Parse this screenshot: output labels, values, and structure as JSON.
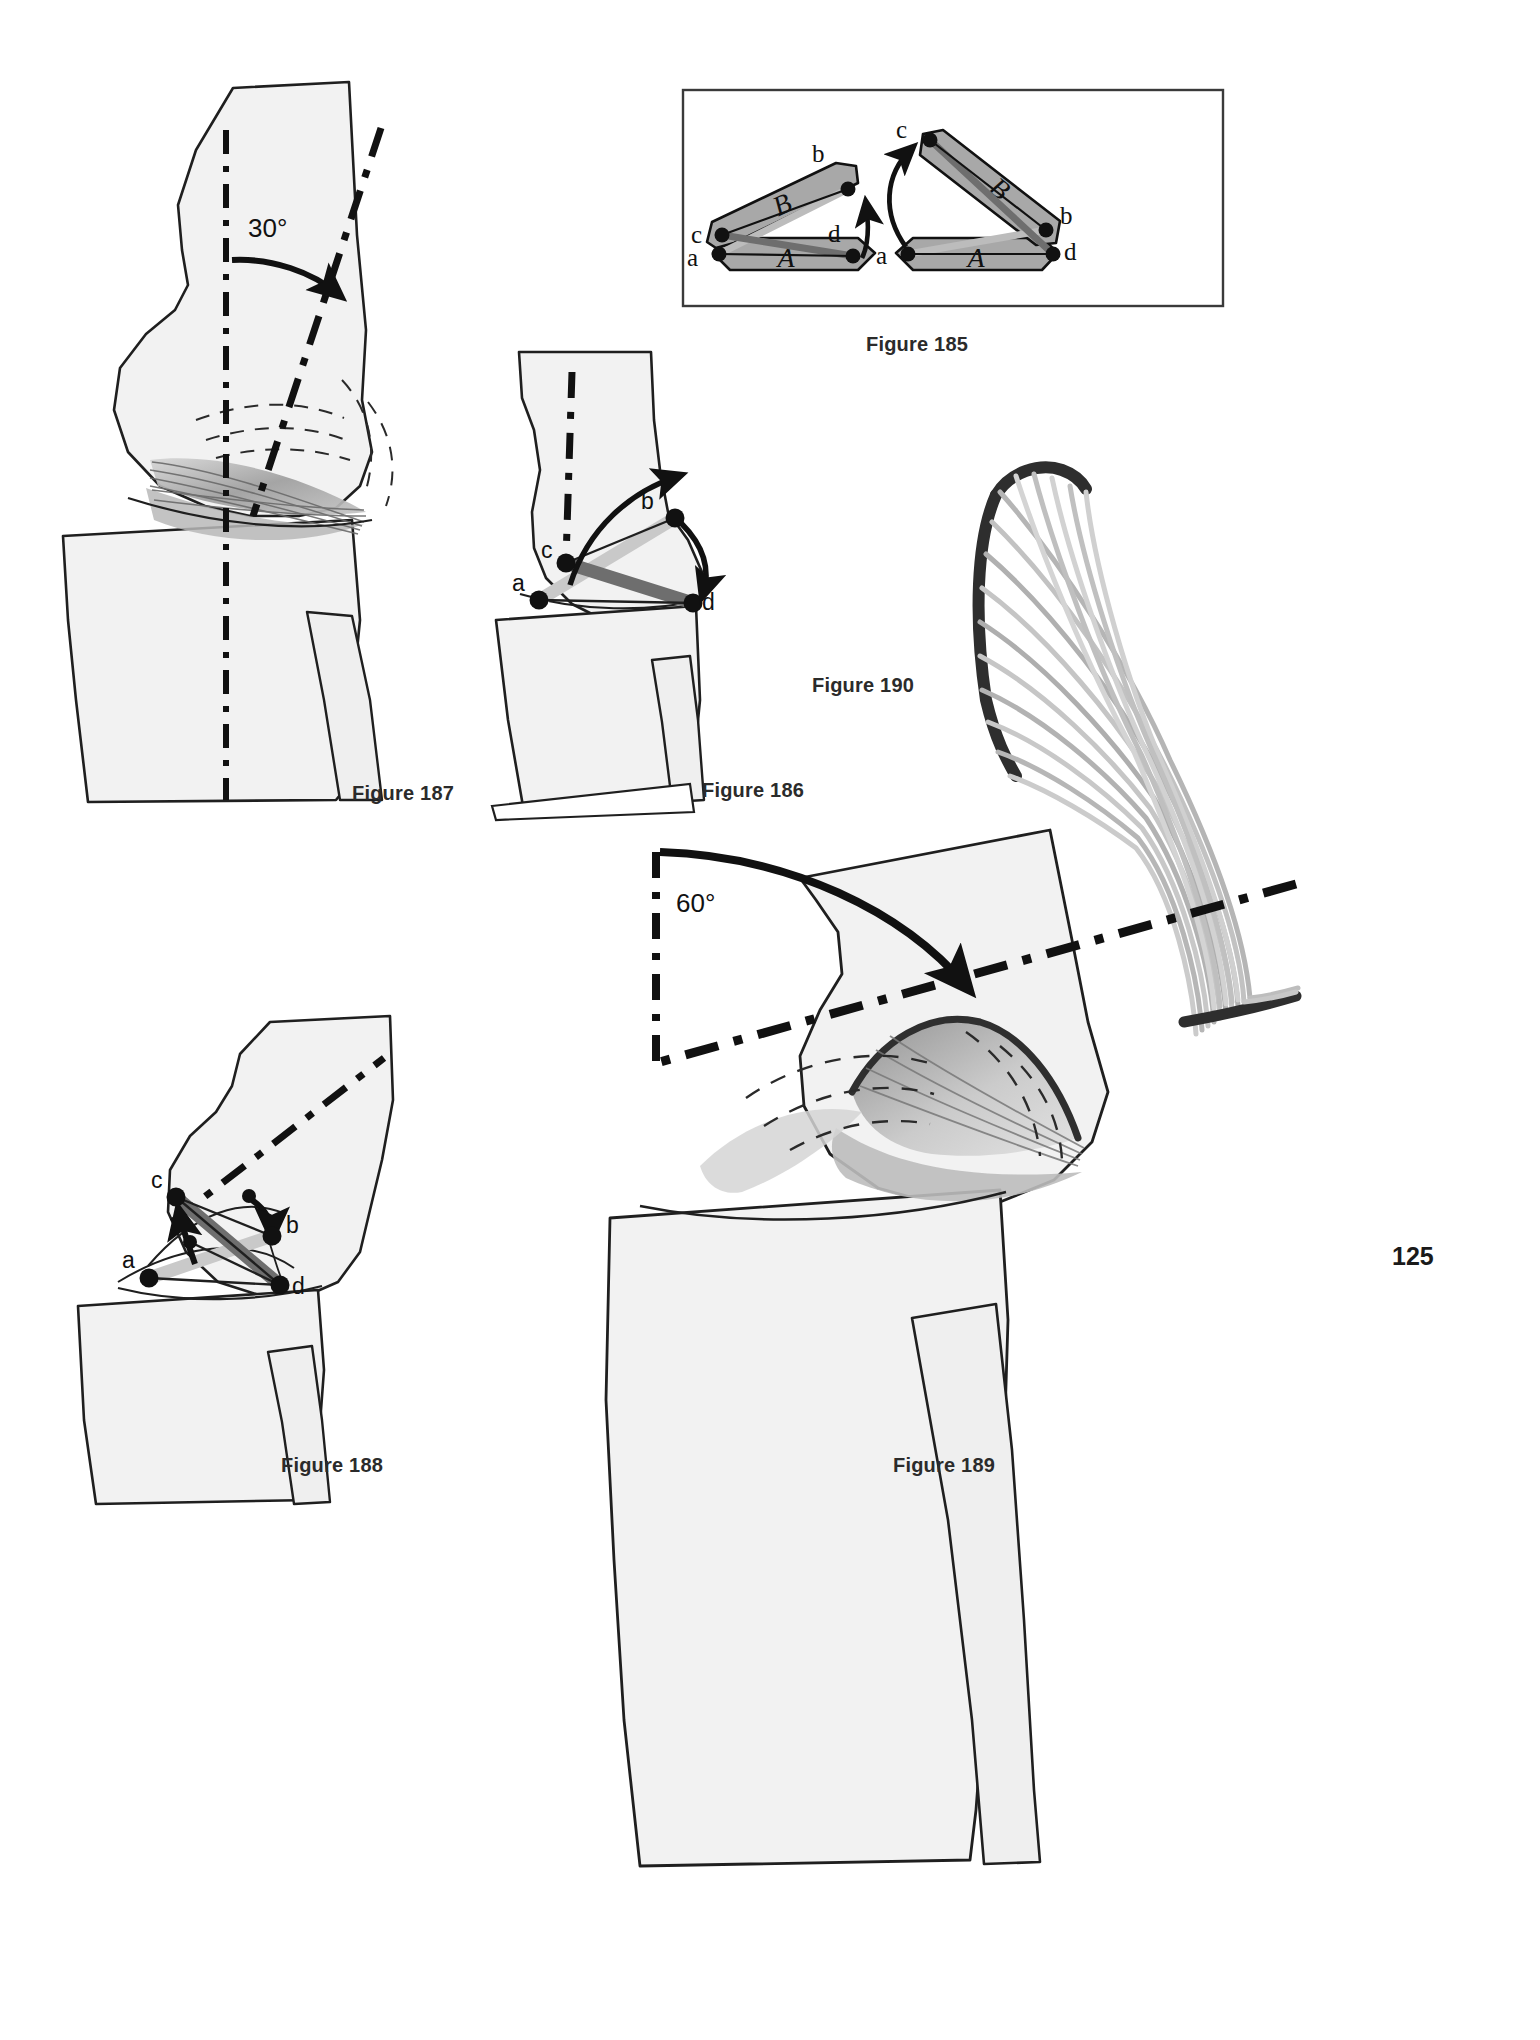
{
  "page": {
    "number": "125",
    "background_color": "#ffffff",
    "width": 1540,
    "height": 2040
  },
  "palette": {
    "bone_fill": "#f2f2f2",
    "bone_outline": "#1f1f1f",
    "block_fill": "#a8a8a8",
    "light_ligament": "#c9c9c9",
    "dark_ligament": "#6e6e6e",
    "ink": "#111111",
    "caption": "#2b2b2b"
  },
  "figures": [
    {
      "id": "figure-187",
      "caption": "Figure 187",
      "caption_x": 352,
      "caption_y": 796,
      "angle_label": "30°",
      "description": "Sagittal knee in slight flexion with femoral shaft axis rotated 30 degrees from vertical reference axis; cruciate ligament sheet shown as twisted grey band."
    },
    {
      "id": "figure-186",
      "caption": "Figure 186",
      "caption_x": 702,
      "caption_y": 793,
      "points": [
        "a",
        "b",
        "c",
        "d"
      ],
      "description": "Sagittal knee near extension, four-bar cruciate linkage with labelled insertion points a, b, c, d and curved arrows showing travel of b and d."
    },
    {
      "id": "figure-185",
      "caption": "Figure 185",
      "caption_x": 866,
      "caption_y": 347,
      "boxed": true,
      "sub_diagrams": [
        {
          "name": "left",
          "bar_labels": [
            "A",
            "B"
          ],
          "points": [
            "a",
            "b",
            "c",
            "d"
          ],
          "description": "Four-bar linkage, bar B inclined up to the right, straight arrow at d pointing up"
        },
        {
          "name": "right",
          "bar_labels": [
            "A",
            "B"
          ],
          "points": [
            "a",
            "b",
            "c",
            "d"
          ],
          "description": "Same linkage after rotation, bar B inclined down to the right, curved arrow from a sweeping up to c"
        }
      ]
    },
    {
      "id": "figure-190",
      "caption": "Figure 190",
      "caption_x": 812,
      "caption_y": 688,
      "description": "Isolated twisted ligament fibre fan; parallel grey fibres running from a curved dark proximal attachment to a dark distal attachment, crossing in a narrow twist zone."
    },
    {
      "id": "figure-188",
      "caption": "Figure 188",
      "caption_x": 281,
      "caption_y": 1468,
      "points": [
        "a",
        "b",
        "c",
        "d"
      ],
      "description": "Sagittal knee in flexion, cruciate four-bar linkage with points a, b, c, d, short arrows indicating displacement toward c and toward b."
    },
    {
      "id": "figure-189",
      "caption": "Figure 189",
      "caption_x": 893,
      "caption_y": 1468,
      "angle_label": "60°",
      "description": "Sagittal knee in deep flexion; femoral axis rotated 60 degrees from vertical reference, heavy curved arrow marks the arc, twisted grey cruciate sheet visible in the joint."
    }
  ],
  "labels": {
    "a": "a",
    "b": "b",
    "c": "c",
    "d": "d",
    "A": "A",
    "B": "B",
    "angle30": "30°",
    "angle60": "60°"
  }
}
